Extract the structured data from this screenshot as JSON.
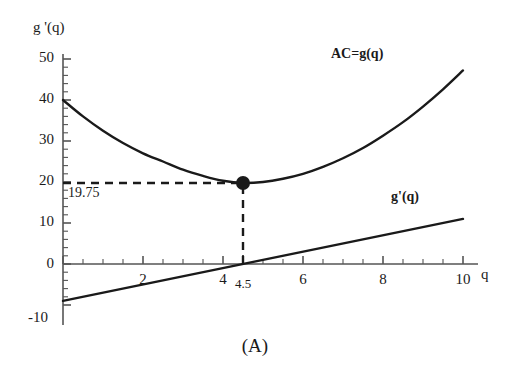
{
  "figure": {
    "caption": "(A)",
    "y_axis_name": "g '(q)",
    "x_axis_name": "q"
  },
  "chart_data": {
    "type": "line",
    "title": "",
    "subtitle": "",
    "caption": "(A)",
    "xlabel": "q",
    "ylabel": "g '(q)",
    "xlim": [
      0,
      10
    ],
    "ylim": [
      -10,
      50
    ],
    "grid": false,
    "legend_position": "inline-curve-labels",
    "x_ticks": [
      0,
      2,
      4,
      6,
      8,
      10
    ],
    "x_tick_labels": [
      "",
      "2",
      "4",
      "6",
      "8",
      "10"
    ],
    "x_minor_tick_step": 0.5,
    "y_ticks": [
      -10,
      0,
      10,
      20,
      30,
      40,
      50
    ],
    "y_tick_labels": [
      "-10",
      "0",
      "10",
      "20",
      "30",
      "40",
      "50"
    ],
    "y_minor_tick_step": 2,
    "special_x_tick": {
      "value": 4.5,
      "label": "4.5"
    },
    "series": [
      {
        "name": "AC=g(q)",
        "label": "AC=g(q)",
        "label_bold": true,
        "type": "curve",
        "color": "#1a1a1a",
        "x": [
          0,
          0.5,
          1,
          1.5,
          2,
          2.5,
          3,
          3.5,
          4,
          4.5,
          5,
          5.5,
          6,
          6.5,
          7,
          7.5,
          8,
          8.5,
          9,
          9.5,
          10
        ],
        "y": [
          40.0,
          36.0,
          32.5,
          29.5,
          27.0,
          25.0,
          23.0,
          21.5,
          20.3,
          19.75,
          20.0,
          20.8,
          22.0,
          23.7,
          25.8,
          28.3,
          31.3,
          34.6,
          38.4,
          42.6,
          47.2
        ]
      },
      {
        "name": "g'(q)",
        "label": "g'(q)",
        "label_bold": true,
        "type": "line",
        "color": "#1a1a1a",
        "x": [
          0,
          10
        ],
        "y": [
          -9,
          11
        ]
      }
    ],
    "marker_points": [
      {
        "x": 4.5,
        "y": 19.75,
        "style": "filled-circle",
        "color": "#1a1a1a",
        "radius": 7
      }
    ],
    "annotations": [
      {
        "text": "19.75",
        "x": 4.5,
        "y": 19.75,
        "type": "value-label"
      }
    ],
    "reference_lines": [
      {
        "orientation": "horizontal",
        "value": 19.75,
        "from_x": 0,
        "to_x": 4.5,
        "style": "dashed",
        "color": "#1a1a1a"
      },
      {
        "orientation": "vertical",
        "value": 4.5,
        "from_y": 0,
        "to_y": 19.75,
        "style": "dashed",
        "color": "#1a1a1a"
      }
    ]
  }
}
